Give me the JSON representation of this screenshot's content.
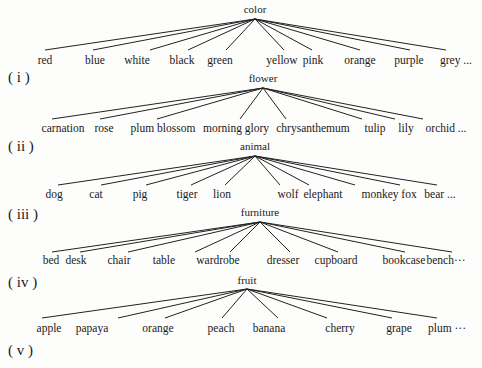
{
  "trees": [
    {
      "id": "color",
      "root": "color",
      "root_pos": {
        "x": 255,
        "y": 13
      },
      "apex": {
        "x": 255,
        "y": 19
      },
      "leaf_line_y": 50,
      "leaf_label_y": 64,
      "leaves": [
        {
          "label": "red",
          "x": 45,
          "tx": 45
        },
        {
          "label": "blue",
          "x": 93,
          "tx": 95
        },
        {
          "label": "white",
          "x": 150,
          "tx": 137
        },
        {
          "label": "black",
          "x": 188,
          "tx": 182
        },
        {
          "label": "green",
          "x": 226,
          "tx": 220
        },
        {
          "label": "yellow",
          "x": 284,
          "tx": 282
        },
        {
          "label": "pink",
          "x": 312,
          "tx": 313
        },
        {
          "label": "orange",
          "x": 360,
          "tx": 360
        },
        {
          "label": "purple",
          "x": 410,
          "tx": 409
        },
        {
          "label": "grey ...",
          "x": 446,
          "tx": 456
        }
      ]
    },
    {
      "id": "flower",
      "root": "flower",
      "root_pos": {
        "x": 263,
        "y": 82
      },
      "apex": {
        "x": 263,
        "y": 88
      },
      "leaf_line_y": 119,
      "leaf_label_y": 132,
      "leaves": [
        {
          "label": "carnation",
          "x": 52,
          "tx": 63
        },
        {
          "label": "rose",
          "x": 100,
          "tx": 104
        },
        {
          "label": "plum blossom",
          "x": 157,
          "tx": 163
        },
        {
          "label": "morning glory",
          "x": 240,
          "tx": 236
        },
        {
          "label": "chrysanthemum",
          "x": 286,
          "tx": 313
        },
        {
          "label": "tulip",
          "x": 362,
          "tx": 375
        },
        {
          "label": "lily",
          "x": 395,
          "tx": 406
        },
        {
          "label": "orchid ...",
          "x": 423,
          "tx": 446
        }
      ]
    },
    {
      "id": "animal",
      "root": "animal",
      "root_pos": {
        "x": 255,
        "y": 150
      },
      "apex": {
        "x": 255,
        "y": 156
      },
      "leaf_line_y": 185,
      "leaf_label_y": 198,
      "leaves": [
        {
          "label": "dog",
          "x": 58,
          "tx": 54
        },
        {
          "label": "cat",
          "x": 101,
          "tx": 96
        },
        {
          "label": "pig",
          "x": 146,
          "tx": 140
        },
        {
          "label": "tiger",
          "x": 191,
          "tx": 187
        },
        {
          "label": "lion",
          "x": 225,
          "tx": 222
        },
        {
          "label": "wolf",
          "x": 280,
          "tx": 288
        },
        {
          "label": "elephant",
          "x": 309,
          "tx": 323
        },
        {
          "label": "monkey",
          "x": 355,
          "tx": 380
        },
        {
          "label": "fox",
          "x": 400,
          "tx": 409
        },
        {
          "label": "bear ...",
          "x": 437,
          "tx": 440
        }
      ]
    },
    {
      "id": "furniture",
      "root": "furniture",
      "root_pos": {
        "x": 260,
        "y": 216
      },
      "apex": {
        "x": 260,
        "y": 222
      },
      "leaf_line_y": 252,
      "leaf_label_y": 264,
      "leaves": [
        {
          "label": "bed",
          "x": 52,
          "tx": 51
        },
        {
          "label": "desk",
          "x": 80,
          "tx": 76
        },
        {
          "label": "chair",
          "x": 128,
          "tx": 119
        },
        {
          "label": "table",
          "x": 195,
          "tx": 164
        },
        {
          "label": "wardrobe",
          "x": 230,
          "tx": 218
        },
        {
          "label": "dresser",
          "x": 290,
          "tx": 283
        },
        {
          "label": "cupboard",
          "x": 338,
          "tx": 336
        },
        {
          "label": "bookcase",
          "x": 405,
          "tx": 404
        },
        {
          "label": "bench···",
          "x": 452,
          "tx": 446
        }
      ]
    },
    {
      "id": "fruit",
      "root": "fruit",
      "root_pos": {
        "x": 247,
        "y": 284
      },
      "apex": {
        "x": 247,
        "y": 289
      },
      "leaf_line_y": 318,
      "leaf_label_y": 332,
      "leaves": [
        {
          "label": "apple",
          "x": 42,
          "tx": 49
        },
        {
          "label": "papaya",
          "x": 118,
          "tx": 92
        },
        {
          "label": "orange",
          "x": 165,
          "tx": 158
        },
        {
          "label": "peach",
          "x": 222,
          "tx": 221
        },
        {
          "label": "banana",
          "x": 278,
          "tx": 269
        },
        {
          "label": "cherry",
          "x": 327,
          "tx": 340
        },
        {
          "label": "grape",
          "x": 392,
          "tx": 399
        },
        {
          "label": "plum ···",
          "x": 437,
          "tx": 447
        }
      ]
    }
  ],
  "roman_labels": [
    {
      "label": "( i )",
      "x": 8,
      "y": 82
    },
    {
      "label": "( ii )",
      "x": 8,
      "y": 151
    },
    {
      "label": "( iii )",
      "x": 8,
      "y": 219
    },
    {
      "label": "( iv )",
      "x": 8,
      "y": 287
    },
    {
      "label": "( v )",
      "x": 8,
      "y": 355
    }
  ],
  "colors": {
    "background": "#fdfdfc",
    "ink": "#1a1a1a"
  }
}
